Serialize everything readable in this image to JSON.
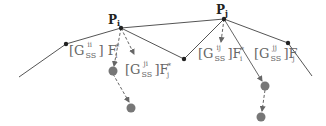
{
  "diagram": {
    "points": {
      "pi": {
        "label": "P",
        "sub": "i"
      },
      "pj": {
        "label": "P",
        "sub": "j"
      }
    },
    "labels": [
      {
        "bracket_open": "[G",
        "sup": "ii",
        "sub": "SS",
        "bracket_close": "]",
        "F": "F",
        "f_sup": "*",
        "f_sub": "i"
      },
      {
        "bracket_open": "[G",
        "sup": "ji",
        "sub": "SS",
        "bracket_close": "]",
        "F": "F",
        "f_sup": "*",
        "f_sub": "j"
      },
      {
        "bracket_open": "[G",
        "sup": "ij",
        "sub": "SS",
        "bracket_close": "]",
        "F": "F",
        "f_sup": "*",
        "f_sub": "i"
      },
      {
        "bracket_open": "[G",
        "sup": "jj",
        "sub": "SS",
        "bracket_close": "]",
        "F": "F",
        "f_sup": "",
        "f_sub": "j"
      }
    ],
    "colors": {
      "line": "#555555",
      "node": "#222222",
      "ghost_node": "#777777",
      "label": "#666666"
    }
  }
}
